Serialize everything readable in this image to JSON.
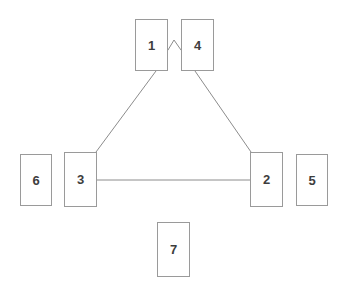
{
  "diagram": {
    "canvas": {
      "width": 343,
      "height": 295,
      "background": "#ffffff"
    },
    "style": {
      "node_fill": "#ffffff",
      "node_border": "#9a9a9a",
      "node_border_width": 1,
      "label_color": "#3d3d3d",
      "label_size": 13,
      "edge_color": "#8c8c8c",
      "edge_width": 1
    },
    "nodes": [
      {
        "id": "node-1",
        "label": "1",
        "x": 135,
        "y": 19,
        "w": 33,
        "h": 52
      },
      {
        "id": "node-4",
        "label": "4",
        "x": 181,
        "y": 19,
        "w": 33,
        "h": 52
      },
      {
        "id": "node-6",
        "label": "6",
        "x": 20,
        "y": 154,
        "w": 32,
        "h": 52
      },
      {
        "id": "node-3",
        "label": "3",
        "x": 64,
        "y": 152,
        "w": 33,
        "h": 55
      },
      {
        "id": "node-2",
        "label": "2",
        "x": 250,
        "y": 152,
        "w": 33,
        "h": 55
      },
      {
        "id": "node-5",
        "label": "5",
        "x": 296,
        "y": 154,
        "w": 32,
        "h": 52
      },
      {
        "id": "node-7",
        "label": "7",
        "x": 157,
        "y": 222,
        "w": 33,
        "h": 55
      }
    ],
    "edges": [
      {
        "id": "edge-1-4",
        "from": "node-1",
        "to": "node-4",
        "shape": "peak",
        "points": "168,50 174,40 181,50"
      },
      {
        "id": "edge-1-3",
        "from": "node-1",
        "to": "node-3",
        "shape": "line",
        "points": "156,71 96,152"
      },
      {
        "id": "edge-4-2",
        "from": "node-4",
        "to": "node-2",
        "shape": "line",
        "points": "195,71 251,152"
      },
      {
        "id": "edge-3-2",
        "from": "node-3",
        "to": "node-2",
        "shape": "line",
        "points": "97,180 250,180"
      }
    ],
    "unconnected_nodes": [
      "node-6",
      "node-5",
      "node-7"
    ]
  }
}
